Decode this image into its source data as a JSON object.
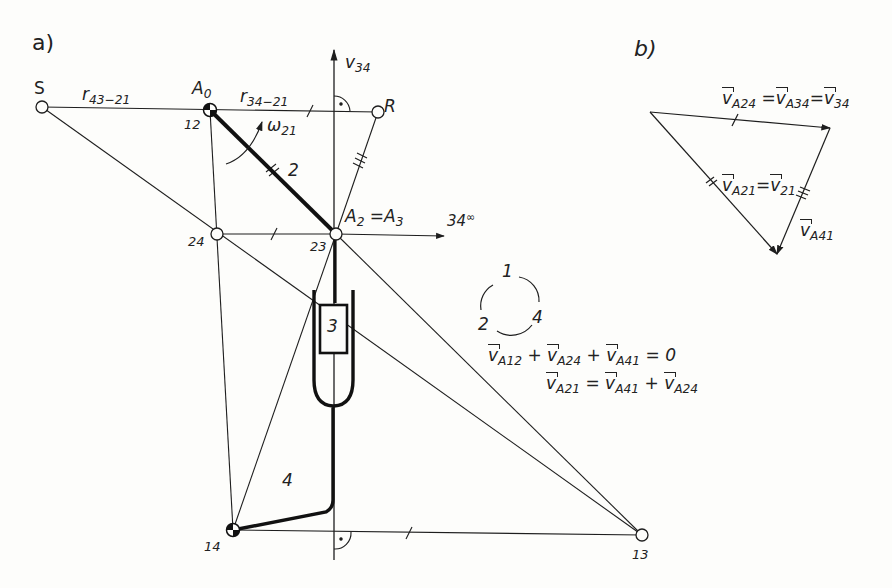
{
  "figure": {
    "panel_a_label": "a)",
    "panel_b_label": "b)"
  },
  "panel_a": {
    "points": {
      "S": {
        "label": "S",
        "x": 42,
        "y": 107
      },
      "A0": {
        "label": "A",
        "sub": "0",
        "pole": "12",
        "x": 210,
        "y": 110
      },
      "R": {
        "label": "R",
        "x": 378,
        "y": 112
      },
      "P24": {
        "pole": "24",
        "x": 217,
        "y": 234
      },
      "A2": {
        "label": "A",
        "sub": "2",
        "eq": "=",
        "label2": "A",
        "sub2": "3",
        "pole": "23",
        "x": 336,
        "y": 234
      },
      "P14": {
        "pole": "14",
        "x": 233,
        "y": 530
      },
      "P13": {
        "pole": "13",
        "x": 642,
        "y": 535
      }
    },
    "radius_labels": {
      "r43_21": {
        "base": "r",
        "sub": "43−21"
      },
      "r34_21": {
        "base": "r",
        "sub": "34−21"
      }
    },
    "axis_v34": {
      "base": "v",
      "sub": "34"
    },
    "axis_34inf": {
      "base": "34",
      "sup": "∞"
    },
    "omega": {
      "base": "ω",
      "sub": "21"
    },
    "links": {
      "link2": "2",
      "link3": "3",
      "link4": "4"
    },
    "pole_circle": {
      "n1": "1",
      "n2": "2",
      "n4": "4"
    },
    "equations": {
      "eq1": {
        "t1": "v",
        "s1": "A12",
        "op1": "+",
        "t2": "v",
        "s2": "A24",
        "op2": "+",
        "t3": "v",
        "s3": "A41",
        "rhs": "= 0"
      },
      "eq2": {
        "t1": "v",
        "s1": "A21",
        "eq": "=",
        "t2": "v",
        "s2": "A41",
        "op": "+",
        "t3": "v",
        "s3": "A24"
      }
    }
  },
  "panel_b": {
    "top_label": {
      "t1": "v",
      "s1": "A24",
      "eq1": "=",
      "t2": "v",
      "s2": "A34",
      "eq2": "=",
      "t3": "v",
      "s3": "34"
    },
    "left_label": {
      "t1": "v",
      "s1": "A21",
      "eq": "=",
      "t2": "v",
      "s2": "21"
    },
    "right_label": {
      "t1": "v",
      "s1": "A41"
    },
    "triangle": {
      "p1": [
        650,
        112
      ],
      "p2": [
        830,
        128
      ],
      "p3": [
        777,
        254
      ]
    }
  },
  "colors": {
    "ink": "#1e1e1e",
    "paper": "#fdfdfb"
  }
}
